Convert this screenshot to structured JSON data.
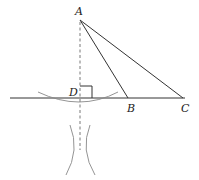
{
  "diagram": {
    "type": "geometry-construction",
    "points": {
      "A": {
        "label": "A",
        "x": 80,
        "y": 20
      },
      "B": {
        "label": "B",
        "x": 128,
        "y": 98
      },
      "C": {
        "label": "C",
        "x": 183,
        "y": 98
      },
      "D": {
        "label": "D",
        "x": 80,
        "y": 98
      }
    },
    "labels": {
      "A": "A",
      "B": "B",
      "C": "C",
      "D": "D"
    },
    "segments": [
      "AB",
      "AC",
      "line through B and C"
    ],
    "dashed": [
      "A to arc intersection below line"
    ],
    "marks": [
      "right angle at D"
    ],
    "colors": {
      "line": "#333333",
      "arc": "#888888",
      "dash": "#555555"
    }
  }
}
